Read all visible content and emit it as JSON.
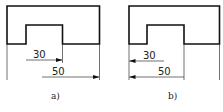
{
  "figures": [
    {
      "id": "a",
      "caption": "a)",
      "dimensions": [
        {
          "value": "30",
          "direction": "right"
        },
        {
          "value": "50",
          "direction": "right"
        }
      ]
    },
    {
      "id": "b",
      "caption": "b)",
      "dimensions": [
        {
          "value": "30",
          "direction": "left"
        },
        {
          "value": "50",
          "direction": "left"
        }
      ]
    }
  ],
  "colors": {
    "line": "#111111",
    "background": "#ffffff"
  }
}
